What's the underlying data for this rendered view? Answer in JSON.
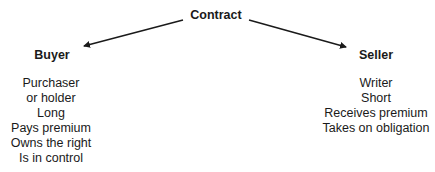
{
  "diagram": {
    "root": {
      "label": "Contract"
    },
    "left": {
      "title": "Buyer",
      "attributes": [
        "Purchaser",
        "or holder",
        "Long",
        "Pays premium",
        "Owns the right",
        "Is in control"
      ]
    },
    "right": {
      "title": "Seller",
      "attributes": [
        "Writer",
        "Short",
        "Receives premium",
        "Takes on obligation"
      ]
    },
    "colors": {
      "text": "#1a1a1a",
      "arrow": "#1a1a1a",
      "background": "#ffffff"
    }
  }
}
